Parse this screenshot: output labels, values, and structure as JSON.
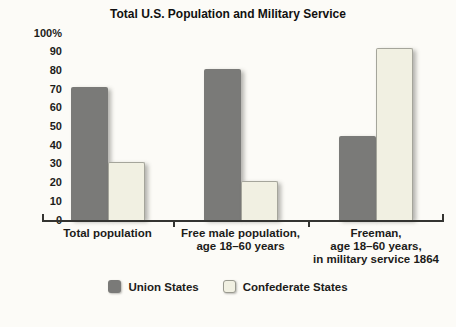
{
  "chart_data": {
    "type": "bar",
    "title": "Total U.S. Population and Military Service",
    "categories": [
      "Total population",
      "Free male population,\nage 18–60 years",
      "Freeman,\nage 18–60 years,\nin military service 1864"
    ],
    "series": [
      {
        "name": "Union States",
        "color": "#7a7a78",
        "values": [
          71,
          81,
          45
        ]
      },
      {
        "name": "Confederate States",
        "color": "#f1f0e2",
        "border_color": "#a5a59b",
        "values": [
          31,
          21,
          92
        ]
      }
    ],
    "xlabel": "",
    "ylabel": "",
    "ylim": [
      0,
      100
    ],
    "ytick_step": 10,
    "ytick_top_label": "100%",
    "grid": false,
    "legend_position": "bottom"
  }
}
